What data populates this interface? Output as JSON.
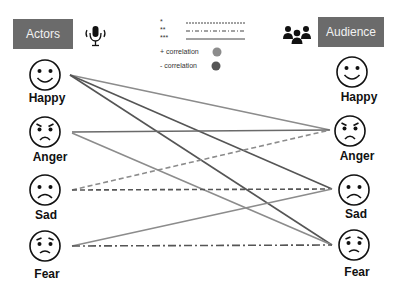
{
  "header": {
    "actors_label": "Actors",
    "audience_label": "Audience",
    "actors_icon": "microphone-icon",
    "audience_icon": "group-icon"
  },
  "legend": {
    "significance": [
      {
        "stars": "*",
        "style": "dashed"
      },
      {
        "stars": "**",
        "style": "dash-dot"
      },
      {
        "stars": "***",
        "style": "solid"
      }
    ],
    "positive_label": "+ correlation",
    "negative_label": "- correlation",
    "positive_color": "#8c8c8c",
    "negative_color": "#555555"
  },
  "actors": [
    {
      "emotion": "Happy"
    },
    {
      "emotion": "Anger"
    },
    {
      "emotion": "Sad"
    },
    {
      "emotion": "Fear"
    }
  ],
  "audience": [
    {
      "emotion": "Happy"
    },
    {
      "emotion": "Anger"
    },
    {
      "emotion": "Sad"
    },
    {
      "emotion": "Fear"
    }
  ],
  "connections": [
    {
      "from": "Happy",
      "to": "Anger",
      "style": "solid",
      "sign": "+"
    },
    {
      "from": "Happy",
      "to": "Sad",
      "style": "solid",
      "sign": "-"
    },
    {
      "from": "Happy",
      "to": "Fear",
      "style": "solid",
      "sign": "-"
    },
    {
      "from": "Anger",
      "to": "Anger",
      "style": "solid",
      "sign": "-"
    },
    {
      "from": "Anger",
      "to": "Fear",
      "style": "solid",
      "sign": "+"
    },
    {
      "from": "Sad",
      "to": "Anger",
      "style": "dashed",
      "sign": "+"
    },
    {
      "from": "Sad",
      "to": "Sad",
      "style": "dashed",
      "sign": "-"
    },
    {
      "from": "Fear",
      "to": "Sad",
      "style": "solid",
      "sign": "+"
    },
    {
      "from": "Fear",
      "to": "Fear",
      "style": "dash-dot",
      "sign": "-"
    }
  ]
}
